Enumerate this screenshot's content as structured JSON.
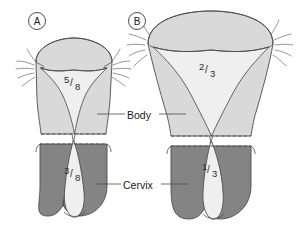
{
  "figure": {
    "background_color": "#ffffff",
    "outline_color": "#4d4d4d",
    "body_color": "#d9d9d9",
    "cavity_color": "#efefef",
    "cervix_color": "#848484",
    "text_color": "#1a1a1a"
  },
  "panels": [
    {
      "id": "panel-a",
      "letter": "A",
      "body_fraction": {
        "numerator": "5",
        "slash": "/",
        "denominator": "8"
      },
      "cervix_fraction": {
        "numerator": "3",
        "slash": "/",
        "denominator": "8"
      }
    },
    {
      "id": "panel-b",
      "letter": "B",
      "body_fraction": {
        "numerator": "2",
        "slash": "/",
        "denominator": "3"
      },
      "cervix_fraction": {
        "numerator": "1",
        "slash": "/",
        "denominator": "3"
      }
    }
  ],
  "callouts": [
    {
      "id": "callout-body",
      "label": "Body"
    },
    {
      "id": "callout-cervix",
      "label": "Cervix"
    }
  ]
}
